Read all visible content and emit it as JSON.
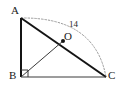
{
  "figure": {
    "type": "geometry-diagram",
    "background_color": "#ffffff",
    "stroke_color": "#141414",
    "thin_stroke_color": "#3a3a3a",
    "arc_color": "#9a9a9a",
    "labels": {
      "A": "A",
      "B": "B",
      "C": "C",
      "O": "O",
      "arc_measure": "14"
    },
    "points": {
      "A": {
        "x": 21,
        "y": 18
      },
      "B": {
        "x": 21,
        "y": 77
      },
      "C": {
        "x": 106,
        "y": 77
      },
      "O": {
        "x": 63,
        "y": 41
      }
    },
    "segments": [
      {
        "name": "AB",
        "from": "A",
        "to": "B",
        "style": "solid",
        "weight": "thick"
      },
      {
        "name": "BC",
        "from": "B",
        "to": "C",
        "style": "solid",
        "weight": "thin"
      },
      {
        "name": "AC",
        "from": "A",
        "to": "C",
        "style": "solid",
        "weight": "thick"
      },
      {
        "name": "BO",
        "from": "B",
        "to": "O",
        "style": "solid",
        "weight": "thin"
      }
    ],
    "arc": {
      "name": "arc-A-to-C",
      "from": "A",
      "to": "C",
      "style": "dotted",
      "label": "14"
    },
    "right_angle_marker": {
      "at": "B",
      "size": 6
    },
    "point_marker": {
      "at": "O",
      "radius": 2
    }
  }
}
